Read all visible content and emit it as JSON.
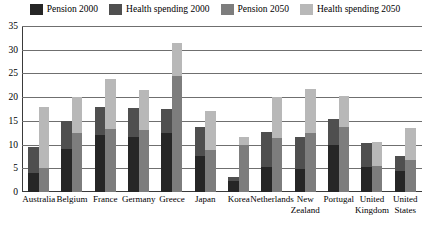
{
  "legend": {
    "items": [
      {
        "label": "Pension 2000",
        "color": "#262626",
        "key": "pension_2000"
      },
      {
        "label": "Health spending 2000",
        "color": "#4f4f4f",
        "key": "health_2000"
      },
      {
        "label": "Pension 2050",
        "color": "#7d7d7d",
        "key": "pension_2050"
      },
      {
        "label": "Health spending 2050",
        "color": "#b8b8b8",
        "key": "health_2050"
      }
    ]
  },
  "axis": {
    "y_ticks": [
      "0",
      "5",
      "10",
      "15",
      "20",
      "25",
      "30",
      "35"
    ],
    "y_min": 0,
    "y_max": 35,
    "y_step": 5
  },
  "chart_data": {
    "type": "bar",
    "title": "",
    "subtitle": "",
    "xlabel": "",
    "ylabel": "",
    "ylim": [
      0,
      35
    ],
    "grid": true,
    "legend_position": "top",
    "categories": [
      "Australia",
      "Belgium",
      "France",
      "Germany",
      "Greece",
      "Japan",
      "Korea",
      "Netherlands",
      "New Zealand",
      "Portugal",
      "United Kingdom",
      "United States"
    ],
    "series": [
      {
        "name": "Pension 2000",
        "color": "#262626",
        "values": [
          4.0,
          9.0,
          12.0,
          11.5,
          12.5,
          7.5,
          2.3,
          5.2,
          4.9,
          10.0,
          5.2,
          4.5
        ]
      },
      {
        "name": "Health spending 2000",
        "color": "#4f4f4f",
        "values": [
          9.5,
          15.0,
          18.0,
          17.8,
          17.5,
          13.8,
          3.1,
          12.6,
          11.7,
          15.3,
          10.3,
          7.5
        ]
      },
      {
        "name": "Pension 2050",
        "color": "#7d7d7d",
        "values": [
          5.0,
          12.5,
          13.2,
          13.0,
          24.5,
          8.9,
          10.0,
          11.3,
          12.5,
          13.8,
          5.5,
          6.8
        ]
      },
      {
        "name": "Health spending 2050",
        "color": "#b8b8b8",
        "values": [
          17.9,
          20.0,
          23.9,
          21.5,
          31.5,
          17.0,
          11.6,
          20.0,
          21.8,
          20.3,
          10.6,
          13.6
        ]
      }
    ]
  }
}
